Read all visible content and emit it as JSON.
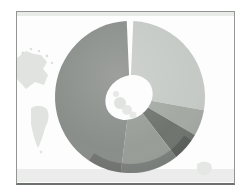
{
  "window": {
    "background_color": "#ffffff"
  },
  "frame": {
    "border_color": "#919691",
    "bottom_border_color": "#6d726d"
  },
  "map_background": {
    "sea_color": "#fdfdfd",
    "land_color": "#e0e3e0",
    "top_band_color": "#e9ebe9",
    "bottom_band_color": "#ececec"
  },
  "chart_data": {
    "type": "pie",
    "subtype": "donut-3d",
    "title": "",
    "legend": "none",
    "axis_labels": "none",
    "data_labels": "none",
    "background": "faint world map inside gray frame",
    "slices": [
      {
        "id": "slice-1",
        "color": "#c6cac6",
        "start_deg": 2.5,
        "end_deg": 100,
        "value_pct": 27.1
      },
      {
        "id": "slice-2",
        "color": "#a4a9a4",
        "start_deg": 100,
        "end_deg": 120,
        "value_pct": 5.6
      },
      {
        "id": "slice-3",
        "color": "#6f746f",
        "start_deg": 120,
        "end_deg": 142,
        "value_pct": 6.1
      },
      {
        "id": "slice-4",
        "color": "#989d98",
        "start_deg": 142,
        "end_deg": 187,
        "value_pct": 12.5
      },
      {
        "id": "slice-5",
        "color": "#8a8e8a",
        "start_deg": 187,
        "end_deg": 357.5,
        "value_pct": 47.4
      }
    ],
    "seam_gap": {
      "at_deg": 0,
      "width_deg": 5,
      "color": "#ffffff"
    },
    "depth_rim": {
      "start_deg": 125,
      "end_deg": 213,
      "color": "rgba(30,34,30,0.22)"
    },
    "hole_color": "#fdfdfd"
  }
}
